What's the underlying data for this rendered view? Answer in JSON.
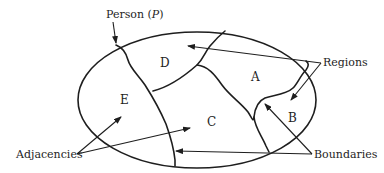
{
  "diagram": {
    "type": "map-region-adjacency",
    "labels": {
      "person": "Person (",
      "person_var": "P",
      "person_close": ")",
      "regions": "Regions",
      "adjacencies": "Adjacencies",
      "boundaries": "Boundaries"
    },
    "regions": [
      {
        "id": "D",
        "label": "D"
      },
      {
        "id": "A",
        "label": "A"
      },
      {
        "id": "E",
        "label": "E"
      },
      {
        "id": "C",
        "label": "C"
      },
      {
        "id": "B",
        "label": "B"
      }
    ],
    "colors": {
      "ink": "#1e1e1e",
      "background": "#ffffff"
    }
  }
}
